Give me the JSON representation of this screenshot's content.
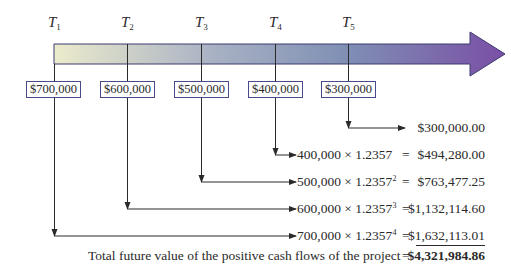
{
  "timeline": {
    "periods": [
      {
        "label": "T",
        "sub": "1"
      },
      {
        "label": "T",
        "sub": "2"
      },
      {
        "label": "T",
        "sub": "3"
      },
      {
        "label": "T",
        "sub": "4"
      },
      {
        "label": "T",
        "sub": "5"
      }
    ],
    "gradient": {
      "start": "#e8e8c8",
      "mid": "#8898b8",
      "end": "#7a50a8"
    }
  },
  "cash_flows": [
    {
      "period": "T1",
      "amount": "$700,000"
    },
    {
      "period": "T2",
      "amount": "$600,000"
    },
    {
      "period": "T3",
      "amount": "$500,000"
    },
    {
      "period": "T4",
      "amount": "$400,000"
    },
    {
      "period": "T5",
      "amount": "$300,000"
    }
  ],
  "calculations": [
    {
      "expr": "",
      "exp": "",
      "equals": "",
      "value": "$300,000.00"
    },
    {
      "expr": "400,000 × 1.2357",
      "exp": "",
      "equals": "=",
      "value": "$494,280.00"
    },
    {
      "expr": "500,000 × 1.2357",
      "exp": "2",
      "equals": "=",
      "value": "$763,477.25"
    },
    {
      "expr": "600,000 × 1.2357",
      "exp": "3",
      "equals": "=",
      "value": "$1,132,114.60"
    },
    {
      "expr": "700,000 × 1.2357",
      "exp": "4",
      "equals": "=",
      "value": "$1,632,113.01"
    }
  ],
  "total": {
    "label": "Total future value of the positive cash flows of the project",
    "equals": "=",
    "value": "$4,321,984.86"
  }
}
